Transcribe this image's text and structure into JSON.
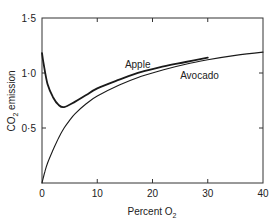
{
  "chart_data": {
    "type": "line",
    "title": "",
    "xlabel": "Percent O",
    "xlabel_sub": "2",
    "ylabel_prefix": "CO",
    "ylabel_sub": "2",
    "ylabel_suffix": " emission",
    "xlim": [
      0,
      40
    ],
    "ylim": [
      0,
      1.5
    ],
    "grid": false,
    "legend": "inline labels",
    "x_ticks": [
      0,
      10,
      20,
      30,
      40
    ],
    "x_tick_labels": [
      "0",
      "10",
      "20",
      "30",
      "40"
    ],
    "y_ticks": [
      0.5,
      1.0,
      1.5
    ],
    "y_tick_labels": [
      "0·5",
      "1·0",
      "1·5"
    ],
    "series": [
      {
        "name": "Apple",
        "label_pos": [
          15,
          1.05
        ],
        "stroke_width": 1.8,
        "x": [
          0,
          0.3,
          1,
          2,
          3,
          4,
          6,
          8,
          10,
          14,
          18,
          22,
          26,
          30
        ],
        "y": [
          1.18,
          1.08,
          0.9,
          0.78,
          0.71,
          0.69,
          0.74,
          0.8,
          0.86,
          0.94,
          1.01,
          1.06,
          1.1,
          1.14
        ]
      },
      {
        "name": "Avocado",
        "label_pos": [
          25,
          0.95
        ],
        "stroke_width": 1.1,
        "x": [
          0,
          0.5,
          1,
          2,
          3,
          4,
          5,
          6,
          8,
          10,
          14,
          18,
          22,
          26,
          30,
          35,
          40
        ],
        "y": [
          0,
          0.1,
          0.18,
          0.3,
          0.41,
          0.5,
          0.57,
          0.63,
          0.72,
          0.79,
          0.89,
          0.97,
          1.03,
          1.08,
          1.12,
          1.16,
          1.19
        ]
      }
    ]
  }
}
